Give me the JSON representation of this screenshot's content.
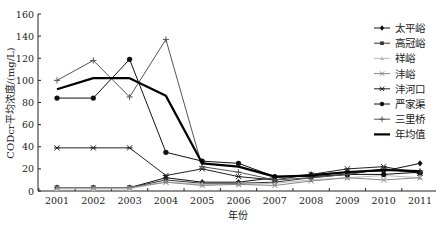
{
  "chart_data": {
    "type": "line",
    "title": "",
    "xlabel": "年份",
    "ylabel": "CODcr平均浓度/(mg/L)",
    "ylim": [
      0,
      160
    ],
    "yticks": [
      0,
      20,
      40,
      60,
      80,
      100,
      120,
      140,
      160
    ],
    "categories": [
      "2001",
      "2002",
      "2003",
      "2004",
      "2005",
      "2006",
      "2007",
      "2008",
      "2009",
      "2010",
      "2011"
    ],
    "legend_position": "right",
    "grid": false,
    "series": [
      {
        "name": "太平峪",
        "marker": "diamond",
        "color": "#111111",
        "width": 1,
        "values": [
          3,
          3,
          3,
          12,
          8,
          8,
          12,
          15,
          17,
          18,
          25
        ]
      },
      {
        "name": "高冠峪",
        "marker": "square",
        "color": "#333333",
        "width": 1,
        "values": [
          3,
          3,
          3,
          10,
          7,
          7,
          8,
          12,
          15,
          20,
          16
        ]
      },
      {
        "name": "祥峪",
        "marker": "triangle",
        "color": "#bbbbbb",
        "width": 1,
        "values": [
          2,
          2,
          2,
          8,
          6,
          6,
          7,
          10,
          12,
          14,
          12
        ]
      },
      {
        "name": "沣峪",
        "marker": "x",
        "color": "#888888",
        "width": 1,
        "values": [
          3,
          3,
          3,
          8,
          5,
          6,
          5,
          9,
          12,
          10,
          12
        ]
      },
      {
        "name": "沣河口",
        "marker": "star",
        "color": "#222222",
        "width": 1,
        "values": [
          39,
          39,
          39,
          14,
          20,
          13,
          10,
          15,
          20,
          22,
          16
        ]
      },
      {
        "name": "严家渠",
        "marker": "circle",
        "color": "#111111",
        "width": 1,
        "values": [
          84,
          84,
          119,
          35,
          27,
          25,
          13,
          13,
          15,
          15,
          17
        ]
      },
      {
        "name": "三里桥",
        "marker": "plus",
        "color": "#555555",
        "width": 1,
        "values": [
          100,
          118,
          85,
          137,
          22,
          17,
          10,
          12,
          15,
          20,
          18
        ]
      },
      {
        "name": "年均值",
        "marker": "none",
        "color": "#000000",
        "width": 2.2,
        "values": [
          92,
          102,
          102,
          86,
          25,
          22,
          13,
          14,
          17,
          19,
          18
        ]
      }
    ]
  }
}
